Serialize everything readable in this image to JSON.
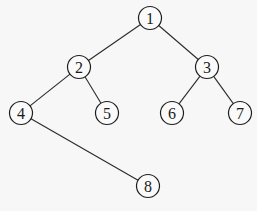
{
  "diagram": {
    "type": "binary-tree",
    "node_radius": 11.5,
    "colors": {
      "background": "#f7f7f7",
      "stroke": "#1e1e1e",
      "text": "#1a1a1a"
    },
    "nodes": [
      {
        "id": "1",
        "label": "1",
        "x": 150,
        "y": 18
      },
      {
        "id": "2",
        "label": "2",
        "x": 79,
        "y": 67
      },
      {
        "id": "3",
        "label": "3",
        "x": 207,
        "y": 67
      },
      {
        "id": "4",
        "label": "4",
        "x": 21,
        "y": 113
      },
      {
        "id": "5",
        "label": "5",
        "x": 107,
        "y": 113
      },
      {
        "id": "6",
        "label": "6",
        "x": 172,
        "y": 113
      },
      {
        "id": "7",
        "label": "7",
        "x": 240,
        "y": 113
      },
      {
        "id": "8",
        "label": "8",
        "x": 148,
        "y": 186
      }
    ],
    "edges": [
      {
        "from": "1",
        "to": "2"
      },
      {
        "from": "1",
        "to": "3"
      },
      {
        "from": "2",
        "to": "4"
      },
      {
        "from": "2",
        "to": "5"
      },
      {
        "from": "3",
        "to": "6"
      },
      {
        "from": "3",
        "to": "7"
      },
      {
        "from": "4",
        "to": "8"
      }
    ]
  }
}
